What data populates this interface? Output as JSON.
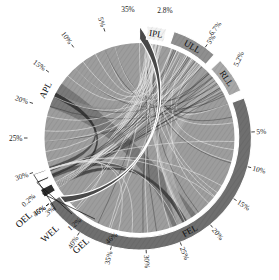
{
  "figure": {
    "type": "chord-diagram",
    "background": "#ffffff",
    "center": {
      "x": 139.5,
      "y": 138
    },
    "radii": {
      "ribbon_outer": 96,
      "arc_inner": 99,
      "arc_outer": 112,
      "tick_label": 121
    }
  },
  "chart_data": {
    "type": "chord",
    "title": "",
    "unit": "%",
    "categories": [
      "APL",
      "IPL",
      "ULL",
      "RLL",
      "FEL",
      "GEL",
      "WEL",
      "OEL"
    ],
    "values": [
      35.0,
      2.8,
      6.7,
      5.2,
      46.0,
      1.2,
      0.3,
      0.2
    ],
    "segment_labels": [
      "APL",
      "IPL",
      "ULL",
      "RLL",
      "FEL",
      "GEL",
      "WEL",
      "OEL"
    ],
    "segment_values_text": [
      "35%",
      "2.8%",
      "6.7%",
      "5.2%",
      "46%",
      "1.2%",
      ".3%",
      "0.2%"
    ],
    "segments": [
      {
        "name": "APL",
        "value": 35.0,
        "value_text": "35%",
        "color": "#4a4a4a",
        "start_deg": -90.0,
        "end_deg": -216.0,
        "ticks": [
          {
            "text": "5%",
            "value": 5
          },
          {
            "text": "10%",
            "value": 10
          },
          {
            "text": "15%",
            "value": 15
          },
          {
            "text": "20%",
            "value": 20
          },
          {
            "text": "25%",
            "value": 25
          },
          {
            "text": "30%",
            "value": 30
          },
          {
            "text": "35%",
            "value": 35
          }
        ]
      },
      {
        "name": "IPL",
        "value": 2.8,
        "value_text": "2.8%",
        "color": "#f2f2f2",
        "start_deg": -86.0,
        "end_deg": -76.0,
        "ticks": []
      },
      {
        "name": "ULL",
        "value": 6.7,
        "value_text": "6.7%",
        "color": "#8f8f8f",
        "start_deg": -72.0,
        "end_deg": -48.0,
        "ticks": [
          {
            "text": "5%",
            "value": 5
          }
        ]
      },
      {
        "name": "RLL",
        "value": 5.2,
        "value_text": "5.2%",
        "color": "#a8a8a8",
        "start_deg": -44.0,
        "end_deg": -25.0,
        "ticks": []
      },
      {
        "name": "FEL",
        "value": 46.0,
        "value_text": "46%",
        "color": "#6f6f6f",
        "start_deg": -21.0,
        "end_deg": 144.0,
        "ticks": [
          {
            "text": "5%",
            "value": 5
          },
          {
            "text": "10%",
            "value": 10
          },
          {
            "text": "15%",
            "value": 15
          },
          {
            "text": "20%",
            "value": 20
          },
          {
            "text": "25%",
            "value": 25
          },
          {
            "text": "30%",
            "value": 30
          },
          {
            "text": "35%",
            "value": 35
          },
          {
            "text": "40%",
            "value": 40
          },
          {
            "text": "46%",
            "value": 46
          }
        ]
      },
      {
        "name": "GEL",
        "value": 1.2,
        "value_text": "1.2%",
        "color": "#2e2e2e",
        "start_deg": 148.0,
        "end_deg": 152.5,
        "ticks": []
      },
      {
        "name": "WEL",
        "value": 0.3,
        "value_text": ".3%",
        "color": "#2e2e2e",
        "start_deg": 156.0,
        "end_deg": 157.2,
        "ticks": []
      },
      {
        "name": "OEL",
        "value": 0.2,
        "value_text": "0.2%",
        "color": "#2e2e2e",
        "start_deg": 160.5,
        "end_deg": 161.3,
        "ticks": []
      }
    ],
    "tick_labels_all": [
      "0.2%",
      ".3%",
      "1.2%",
      "46%",
      "40%",
      "35%",
      "30%",
      "25%",
      "20%",
      "15%",
      "10%",
      "5%",
      "5.2%",
      "6.7%",
      "5%",
      "2.8%",
      "35%",
      "30%",
      "25%",
      "20%",
      "15%",
      "10%",
      "5%"
    ],
    "ribbons": [
      {
        "source": "APL",
        "target": "FEL",
        "color": "#6b6b6b",
        "opacity": 0.72,
        "width": 52
      },
      {
        "source": "FEL",
        "target": "RLL",
        "color": "#b9b9b9",
        "opacity": 0.62,
        "width": 30
      },
      {
        "source": "FEL",
        "target": "ULL",
        "color": "#a5a5a5",
        "opacity": 0.55,
        "width": 22
      },
      {
        "source": "APL",
        "target": "IPL",
        "color": "#9a9a9a",
        "opacity": 0.5,
        "width": 9
      },
      {
        "source": "APL",
        "target": "ULL",
        "color": "#8b8b8b",
        "opacity": 0.45,
        "width": 7
      },
      {
        "source": "GEL",
        "target": "FEL",
        "color": "#3a3a3a",
        "opacity": 0.8,
        "width": 4
      },
      {
        "source": "APL",
        "target": "GEL",
        "color": "#303030",
        "opacity": 0.85,
        "width": 3
      },
      {
        "source": "IPL",
        "target": "FEL",
        "color": "#cfcfcf",
        "opacity": 0.6,
        "width": 5
      },
      {
        "source": "WEL",
        "target": "FEL",
        "color": "#444444",
        "opacity": 0.7,
        "width": 2
      },
      {
        "source": "OEL",
        "target": "APL",
        "color": "#383838",
        "opacity": 0.7,
        "width": 2
      }
    ],
    "legend": {
      "visible": false,
      "position": "none"
    },
    "grid": false
  }
}
